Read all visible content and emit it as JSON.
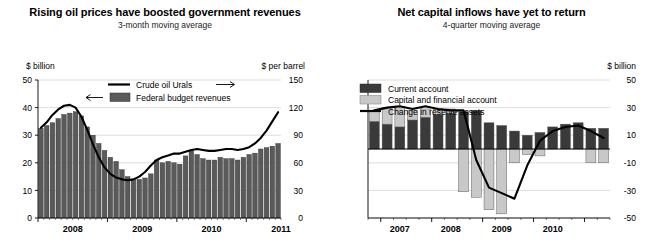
{
  "left": {
    "title": "Rising oil prices have boosted government revenues",
    "subtitle": "3-month moving average",
    "chart_data": {
      "type": "bar",
      "title": "Rising oil prices have boosted government revenues",
      "subtitle": "3-month moving average",
      "xlabel": "",
      "ylabel": "$ billion",
      "y2label": "$ per barrel",
      "ylim": [
        0,
        50
      ],
      "y2lim": [
        0,
        150
      ],
      "yticks": [
        0,
        10,
        20,
        30,
        40,
        50
      ],
      "y2ticks": [
        0,
        30,
        60,
        90,
        120,
        150
      ],
      "grid": true,
      "legend_position": "top",
      "xtick_labels": [
        "2008",
        "2009",
        "2010",
        "2011"
      ],
      "xtick_positions": [
        0,
        12,
        24,
        36
      ],
      "x_start": "2008-01",
      "x_end": "2010-12",
      "legend": [
        {
          "name": "Crude oil Urals",
          "marker": "line",
          "color": "#000000",
          "arrow": "right"
        },
        {
          "name": "Federal budget revenues",
          "marker": "bar",
          "color": "#5a5a5a",
          "arrow": "left"
        }
      ],
      "series": [
        {
          "name": "Federal budget revenues",
          "axis": "left",
          "type": "bar",
          "color": "#5a5a5a",
          "values": [
            32.5,
            33.5,
            34.5,
            36.0,
            37.5,
            38.0,
            38.5,
            37.0,
            33.0,
            30.0,
            27.0,
            24.5,
            22.0,
            20.5,
            17.5,
            15.0,
            14.0,
            14.0,
            14.5,
            16.0,
            21.0,
            20.0,
            20.5,
            20.0,
            19.5,
            22.5,
            24.5,
            23.0,
            21.5,
            21.0,
            21.0,
            22.0,
            21.5,
            21.5,
            21.0,
            22.0,
            23.0,
            23.5,
            25.0,
            25.5,
            26.0,
            27.0
          ]
        },
        {
          "name": "Crude oil Urals",
          "axis": "right",
          "type": "line",
          "color": "#000000",
          "values": [
            98,
            104,
            112,
            118,
            122,
            123,
            120,
            110,
            96,
            80,
            66,
            55,
            48,
            44,
            42,
            41,
            42,
            45,
            50,
            57,
            63,
            66,
            68,
            70,
            70,
            72,
            74,
            75,
            74,
            73,
            73,
            74,
            75,
            75,
            74,
            75,
            77,
            81,
            87,
            95,
            105,
            115
          ]
        }
      ]
    }
  },
  "right": {
    "title": "Net capital inflows have yet to return",
    "subtitle": "4-quarter moving average",
    "chart_data": {
      "type": "bar",
      "title": "Net capital inflows have yet to return",
      "subtitle": "4-quarter moving average",
      "xlabel": "",
      "ylabel": "$ billion",
      "ylim": [
        -50,
        50
      ],
      "yticks": [
        -50,
        -30,
        -10,
        10,
        30,
        50
      ],
      "grid": true,
      "stacked": true,
      "legend_position": "top-left",
      "xtick_labels": [
        "2007",
        "2008",
        "2009",
        "2010"
      ],
      "xtick_positions": [
        0,
        4,
        8,
        12
      ],
      "x_start": "2006-Q4",
      "x_end": "2010-Q4",
      "legend": [
        {
          "name": "Current account",
          "marker": "bar",
          "color": "#3a3a3a"
        },
        {
          "name": "Capital and financial account",
          "marker": "bar",
          "color": "#c8c8c8"
        },
        {
          "name": "Change in reserve assets",
          "marker": "line",
          "color": "#000000"
        }
      ],
      "series": [
        {
          "name": "Current account",
          "type": "bar",
          "color": "#3a3a3a",
          "values": [
            20,
            18,
            16,
            21,
            23,
            25,
            26,
            27,
            28,
            19,
            17,
            13,
            10,
            12,
            16,
            18,
            19,
            15,
            15
          ]
        },
        {
          "name": "Capital and financial account",
          "type": "bar",
          "color": "#c8c8c8",
          "values": [
            8,
            12,
            15,
            7,
            6,
            4,
            3,
            -31,
            -35,
            -44,
            -47,
            -10,
            -4,
            -5,
            0,
            0,
            0,
            -10,
            -10
          ]
        },
        {
          "name": "Change in reserve assets",
          "type": "line",
          "color": "#000000",
          "values": [
            28,
            30,
            31,
            29,
            31,
            29,
            28,
            28,
            -8,
            -28,
            -32,
            -36,
            -12,
            6,
            13,
            16,
            17,
            13,
            8
          ]
        }
      ]
    }
  }
}
